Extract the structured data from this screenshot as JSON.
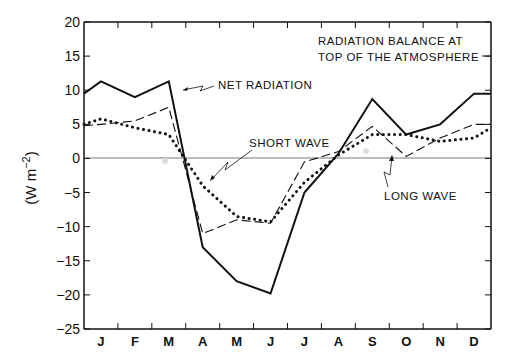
{
  "chart_data": {
    "type": "line",
    "title": "RADIATION BALANCE AT TOP OF THE ATMOSPHERE",
    "title_lines": [
      "RADIATION BALANCE AT",
      "TOP OF THE ATMOSPHERE"
    ],
    "xlabel": "",
    "ylabel": "(W m−2)",
    "ylabel_parts": {
      "pre": "(W m",
      "sup": "−2",
      "post": ")"
    },
    "ylim": [
      -25,
      20
    ],
    "yticks": [
      20,
      15,
      10,
      5,
      0,
      -5,
      -10,
      -15,
      -20,
      -25
    ],
    "ytick_labels": [
      "20",
      "15",
      "10",
      "5",
      "0",
      "−5",
      "−10",
      "−15",
      "−20",
      "−25"
    ],
    "categories": [
      "J",
      "F",
      "M",
      "A",
      "M",
      "J",
      "J",
      "A",
      "S",
      "O",
      "N",
      "D"
    ],
    "grid": false,
    "zero_line": true,
    "series": [
      {
        "name": "NET RADIATION",
        "style": "solid",
        "values": [
          11.3,
          9.0,
          11.3,
          -13.0,
          -18.0,
          -19.8,
          -5.0,
          0.7,
          8.7,
          3.5,
          5.0,
          9.5
        ],
        "start_value": 9.5,
        "end_value": 9.5
      },
      {
        "name": "SHORT WAVE",
        "style": "dotted",
        "values": [
          5.8,
          4.5,
          3.5,
          -4.0,
          -8.5,
          -9.3,
          -3.5,
          0.5,
          3.5,
          3.5,
          2.5,
          3.0
        ],
        "start_value": 5.0,
        "end_value": 4.5
      },
      {
        "name": "LONG WAVE",
        "style": "dashed",
        "values": [
          5.0,
          5.5,
          7.5,
          -11.0,
          -9.0,
          -9.5,
          -0.5,
          1.0,
          4.7,
          0.3,
          3.0,
          5.0
        ],
        "start_value": 4.8,
        "end_value": 5.0
      }
    ],
    "annotations": [
      {
        "text": "NET RADIATION",
        "target_series": "NET RADIATION"
      },
      {
        "text": "SHORT WAVE",
        "target_series": "SHORT WAVE"
      },
      {
        "text": "LONG WAVE",
        "target_series": "LONG WAVE"
      }
    ],
    "legend_position": "inline annotations"
  }
}
